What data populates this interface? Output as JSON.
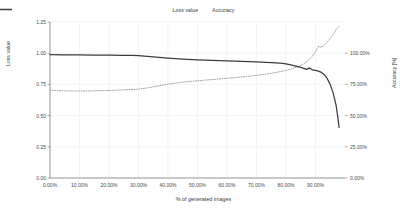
{
  "chart_data": {
    "type": "line",
    "title": "",
    "xlabel": "% of generated images",
    "ylabel": "Loss value",
    "y2label": "Accuracy [%]",
    "xlim": [
      0,
      100
    ],
    "ylim": [
      0.0,
      1.25
    ],
    "y2lim": [
      0.0,
      125.0
    ],
    "grid": true,
    "legend_position": "top-center",
    "xticks": [
      "0.00%",
      "10.00%",
      "20.00%",
      "30.00%",
      "40.00%",
      "50.00%",
      "60.00%",
      "70.00%",
      "80.00%",
      "90.00%"
    ],
    "xtick_values": [
      0,
      10,
      20,
      30,
      40,
      50,
      60,
      70,
      80,
      90
    ],
    "yticks": [
      "0.00",
      "0.25",
      "0.50",
      "0.75",
      "1.00",
      "1.25"
    ],
    "ytick_values": [
      0.0,
      0.25,
      0.5,
      0.75,
      1.0,
      1.25
    ],
    "y2ticks": [
      "0.00%",
      "25.00%",
      "50.00%",
      "75.00%",
      "100.00%"
    ],
    "y2tick_values": [
      0,
      25,
      50,
      75,
      100
    ],
    "series": [
      {
        "name": "Loss value",
        "axis": "left",
        "style": "dotted",
        "color": "#8c8c8c",
        "x": [
          0,
          2,
          4,
          6,
          8,
          10,
          12,
          14,
          16,
          18,
          20,
          22,
          24,
          26,
          28,
          30,
          32,
          34,
          36,
          38,
          40,
          42,
          44,
          46,
          48,
          50,
          52,
          54,
          56,
          58,
          60,
          62,
          64,
          66,
          68,
          70,
          72,
          74,
          76,
          78,
          80,
          82,
          84,
          85,
          86,
          87,
          88,
          89,
          90,
          91,
          92,
          93,
          94,
          95,
          96,
          97,
          98
        ],
        "values": [
          0.705,
          0.701,
          0.699,
          0.698,
          0.697,
          0.697,
          0.697,
          0.698,
          0.699,
          0.7,
          0.701,
          0.703,
          0.705,
          0.707,
          0.709,
          0.712,
          0.718,
          0.726,
          0.735,
          0.744,
          0.752,
          0.759,
          0.765,
          0.77,
          0.775,
          0.779,
          0.783,
          0.787,
          0.791,
          0.795,
          0.799,
          0.803,
          0.807,
          0.812,
          0.817,
          0.822,
          0.828,
          0.835,
          0.843,
          0.852,
          0.862,
          0.875,
          0.892,
          0.902,
          0.915,
          0.932,
          0.952,
          0.978,
          1.012,
          1.055,
          1.048,
          1.062,
          1.09,
          1.12,
          1.15,
          1.19,
          1.215
        ]
      },
      {
        "name": "Accuracy",
        "axis": "right",
        "style": "solid",
        "color": "#3c3c3c",
        "x": [
          0,
          5,
          10,
          15,
          20,
          25,
          28,
          30,
          32,
          35,
          40,
          45,
          50,
          55,
          60,
          65,
          70,
          75,
          78,
          80,
          82,
          84,
          85,
          86,
          87,
          88,
          88.5,
          89,
          90,
          91,
          92,
          93,
          94,
          95,
          96,
          97,
          97.5,
          98
        ],
        "values": [
          98.8,
          98.7,
          98.6,
          98.5,
          98.4,
          98.3,
          98.2,
          98.0,
          97.6,
          97.0,
          96.0,
          95.2,
          94.6,
          94.2,
          93.8,
          93.4,
          93.0,
          92.4,
          92.0,
          91.5,
          90.5,
          89.3,
          88.6,
          87.8,
          87.0,
          88.2,
          87.4,
          86.6,
          86.3,
          85.6,
          84.6,
          82.8,
          79.6,
          74.8,
          68.0,
          58.0,
          50.0,
          40.6
        ]
      }
    ]
  },
  "legend": {
    "items": [
      {
        "label": "Loss value",
        "marker": "dotted-line-marker"
      },
      {
        "label": "Accuracy",
        "marker": "solid-line-marker"
      }
    ]
  },
  "colors": {
    "loss_line": "#8c8c8c",
    "accuracy_line": "#3c3c3c",
    "grid": "#ededed",
    "axis": "#6e6e6e",
    "text": "#3a3a3a",
    "background": "#ffffff"
  }
}
